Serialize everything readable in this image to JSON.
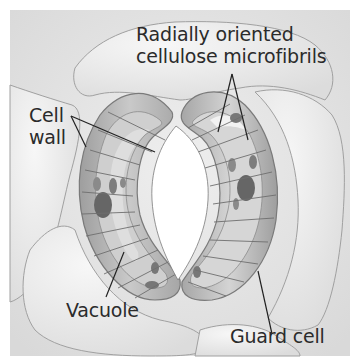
{
  "figure": {
    "labels": {
      "microfibrils_line1": "Radially oriented",
      "microfibrils_line2": "cellulose microfibrils",
      "cell_wall_line1": "Cell",
      "cell_wall_line2": "wall",
      "vacuole": "Vacuole",
      "guard_cell": "Guard cell"
    },
    "colors": {
      "background": "#e4e4e4",
      "epidermal_cell": "#ececec",
      "outline": "#9a9a9a",
      "guard_cell_wall": "#a8a8a8",
      "guard_cell_inner": "#cfcfcf",
      "organelle": "#6f6f6f",
      "leader_line": "#222222",
      "text": "#2b2b2b"
    }
  }
}
